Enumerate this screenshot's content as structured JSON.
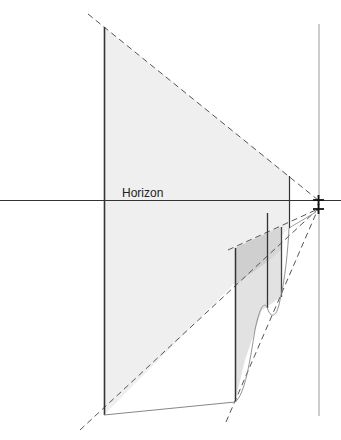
{
  "diagram": {
    "title": "",
    "labels": {
      "horizon": "Horizon"
    },
    "colors": {
      "background": "#ffffff",
      "line": "#333333",
      "dashed": "#555555",
      "fill_light": "#efefef",
      "fill_mid": "#dedede",
      "fill_dark": "#cccccc",
      "thin_line": "#999999"
    },
    "geometry": {
      "horizon_y": 200,
      "vanishing_point": [
        318,
        200
      ],
      "vanishing_point_lower": [
        318,
        209
      ]
    }
  }
}
